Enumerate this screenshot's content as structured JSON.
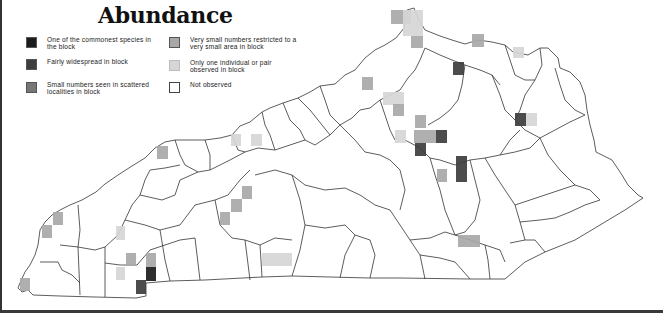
{
  "title": "Abundance",
  "legend": [
    {
      "id": "commonest",
      "label": "One of the commonest species in the block",
      "color": "#1c1c1c",
      "x": 0,
      "y": 0
    },
    {
      "id": "widespread",
      "label": "Fairly widespread in block",
      "color": "#3d3d3d",
      "x": 0,
      "y": 22
    },
    {
      "id": "scattered",
      "label": "Small numbers seen in scattered localities in block",
      "color": "#777777",
      "x": 0,
      "y": 45
    },
    {
      "id": "restricted",
      "label": "Very small numbers restricted to a very small area in block",
      "color": "#a8a8a8",
      "x": 143,
      "y": 0
    },
    {
      "id": "single",
      "label": "Only one individual or pair observed in block",
      "color": "#d6d6d6",
      "x": 143,
      "y": 23
    },
    {
      "id": "not_observed",
      "label": "Not observed",
      "color": "#ffffff",
      "x": 143,
      "y": 45
    }
  ],
  "blocks": [
    {
      "x": 391,
      "y": 10,
      "w": 20,
      "h": 14,
      "level": "restricted"
    },
    {
      "x": 403,
      "y": 10,
      "w": 20,
      "h": 26,
      "level": "single"
    },
    {
      "x": 411,
      "y": 36,
      "w": 12,
      "h": 12,
      "level": "restricted"
    },
    {
      "x": 472,
      "y": 34,
      "w": 12,
      "h": 13,
      "level": "restricted"
    },
    {
      "x": 513,
      "y": 47,
      "w": 11,
      "h": 11,
      "level": "single"
    },
    {
      "x": 453,
      "y": 62,
      "w": 11,
      "h": 13,
      "level": "widespread"
    },
    {
      "x": 362,
      "y": 77,
      "w": 11,
      "h": 13,
      "level": "restricted"
    },
    {
      "x": 383,
      "y": 92,
      "w": 21,
      "h": 13,
      "level": "single"
    },
    {
      "x": 393,
      "y": 104,
      "w": 11,
      "h": 12,
      "level": "restricted"
    },
    {
      "x": 415,
      "y": 115,
      "w": 11,
      "h": 13,
      "level": "restricted"
    },
    {
      "x": 515,
      "y": 113,
      "w": 11,
      "h": 13,
      "level": "widespread"
    },
    {
      "x": 526,
      "y": 113,
      "w": 11,
      "h": 13,
      "level": "single"
    },
    {
      "x": 395,
      "y": 130,
      "w": 11,
      "h": 13,
      "level": "single"
    },
    {
      "x": 414,
      "y": 130,
      "w": 22,
      "h": 13,
      "level": "restricted"
    },
    {
      "x": 436,
      "y": 130,
      "w": 11,
      "h": 13,
      "level": "widespread"
    },
    {
      "x": 415,
      "y": 143,
      "w": 11,
      "h": 13,
      "level": "widespread"
    },
    {
      "x": 456,
      "y": 156,
      "w": 11,
      "h": 26,
      "level": "widespread"
    },
    {
      "x": 437,
      "y": 169,
      "w": 10,
      "h": 13,
      "level": "restricted"
    },
    {
      "x": 458,
      "y": 235,
      "w": 22,
      "h": 12,
      "level": "restricted"
    },
    {
      "x": 231,
      "y": 134,
      "w": 10,
      "h": 12,
      "level": "single"
    },
    {
      "x": 251,
      "y": 134,
      "w": 11,
      "h": 12,
      "level": "single"
    },
    {
      "x": 157,
      "y": 146,
      "w": 11,
      "h": 13,
      "level": "restricted"
    },
    {
      "x": 242,
      "y": 186,
      "w": 10,
      "h": 13,
      "level": "restricted"
    },
    {
      "x": 231,
      "y": 199,
      "w": 11,
      "h": 13,
      "level": "restricted"
    },
    {
      "x": 220,
      "y": 212,
      "w": 10,
      "h": 13,
      "level": "restricted"
    },
    {
      "x": 262,
      "y": 253,
      "w": 30,
      "h": 13,
      "level": "single"
    },
    {
      "x": 53,
      "y": 212,
      "w": 10,
      "h": 13,
      "level": "restricted"
    },
    {
      "x": 42,
      "y": 225,
      "w": 10,
      "h": 13,
      "level": "restricted"
    },
    {
      "x": 116,
      "y": 226,
      "w": 9,
      "h": 14,
      "level": "single"
    },
    {
      "x": 126,
      "y": 253,
      "w": 10,
      "h": 13,
      "level": "restricted"
    },
    {
      "x": 146,
      "y": 253,
      "w": 10,
      "h": 14,
      "level": "restricted"
    },
    {
      "x": 116,
      "y": 267,
      "w": 9,
      "h": 13,
      "level": "single"
    },
    {
      "x": 146,
      "y": 267,
      "w": 10,
      "h": 14,
      "level": "commonest"
    },
    {
      "x": 136,
      "y": 280,
      "w": 10,
      "h": 14,
      "level": "widespread"
    },
    {
      "x": 20,
      "y": 278,
      "w": 10,
      "h": 13,
      "level": "restricted"
    }
  ]
}
